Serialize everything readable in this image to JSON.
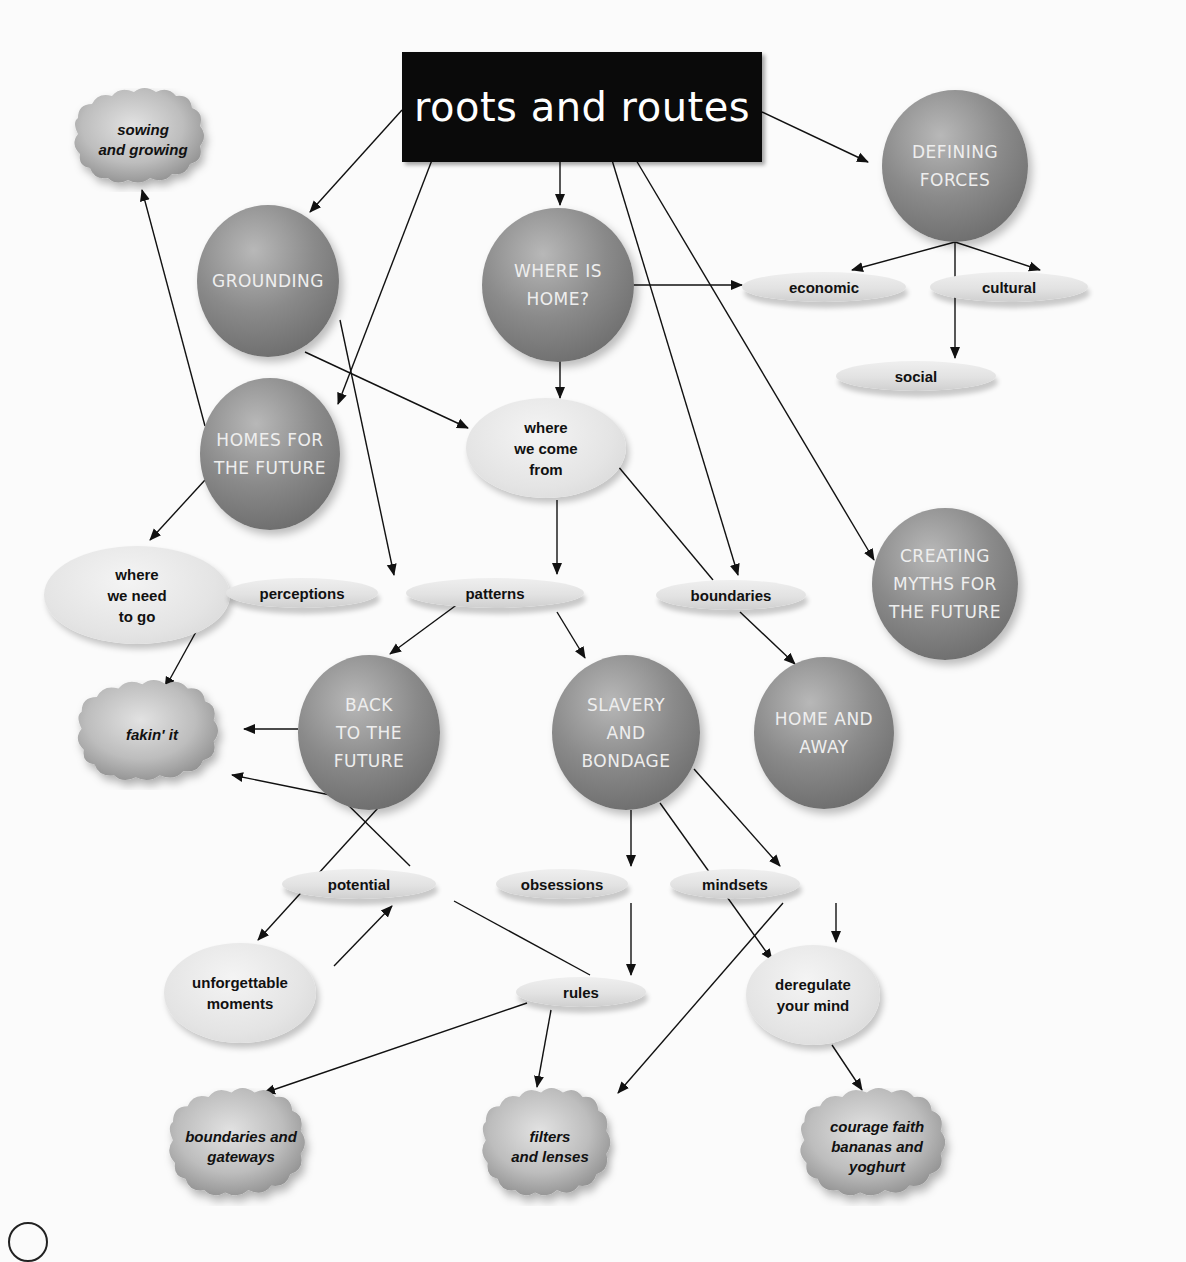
{
  "diagram": {
    "title": "roots and routes",
    "nodes": {
      "title": {
        "label": "roots and routes"
      },
      "sowing": {
        "label": "sowing\nand growing"
      },
      "grounding": {
        "label": "GROUNDING"
      },
      "where_is_home": {
        "label": "WHERE IS\nHOME?"
      },
      "defining_forces": {
        "label": "DEFINING\nFORCES"
      },
      "economic": {
        "label": "economic"
      },
      "cultural": {
        "label": "cultural"
      },
      "social": {
        "label": "social"
      },
      "homes_future": {
        "label": "HOMES FOR\nTHE FUTURE"
      },
      "where_come_from": {
        "label": "where\nwe come\nfrom"
      },
      "where_need_go": {
        "label": "where\nwe need\nto go"
      },
      "perceptions": {
        "label": "perceptions"
      },
      "patterns": {
        "label": "patterns"
      },
      "boundaries": {
        "label": "boundaries"
      },
      "creating_myths": {
        "label": "CREATING\nMYTHS FOR\nTHE FUTURE"
      },
      "fakin_it": {
        "label": "fakin' it"
      },
      "back_future": {
        "label": "BACK\nTO THE\nFUTURE"
      },
      "slavery": {
        "label": "SLAVERY\nAND\nBONDAGE"
      },
      "home_away": {
        "label": "HOME AND\nAWAY"
      },
      "potential": {
        "label": "potential"
      },
      "obsessions": {
        "label": "obsessions"
      },
      "mindsets": {
        "label": "mindsets"
      },
      "unforgettable": {
        "label": "unforgettable\nmoments"
      },
      "rules": {
        "label": "rules"
      },
      "deregulate": {
        "label": "deregulate\nyour mind"
      },
      "boundaries_gateways": {
        "label": "boundaries and\ngateways"
      },
      "filters_lenses": {
        "label": "filters\nand lenses"
      },
      "courage": {
        "label": "courage faith\nbananas and\nyoghurt"
      }
    },
    "edges": [
      {
        "from": "title",
        "to": "grounding"
      },
      {
        "from": "title",
        "to": "homes_future"
      },
      {
        "from": "title",
        "to": "where_is_home"
      },
      {
        "from": "title",
        "to": "boundaries"
      },
      {
        "from": "title",
        "to": "creating_myths"
      },
      {
        "from": "title",
        "to": "defining_forces"
      },
      {
        "from": "defining_forces",
        "to": "economic"
      },
      {
        "from": "defining_forces",
        "to": "cultural"
      },
      {
        "from": "defining_forces",
        "to": "social"
      },
      {
        "from": "where_is_home",
        "to": "economic"
      },
      {
        "from": "where_is_home",
        "to": "where_come_from"
      },
      {
        "from": "grounding",
        "to": "where_come_from"
      },
      {
        "from": "grounding",
        "to": "perceptions"
      },
      {
        "from": "homes_future",
        "to": "sowing"
      },
      {
        "from": "homes_future",
        "to": "where_need_go"
      },
      {
        "from": "where_need_go",
        "to": "perceptions",
        "arrow": false
      },
      {
        "from": "where_need_go",
        "to": "fakin_it"
      },
      {
        "from": "where_come_from",
        "to": "patterns"
      },
      {
        "from": "where_come_from",
        "to": "boundaries",
        "arrow": false
      },
      {
        "from": "patterns",
        "to": "back_future"
      },
      {
        "from": "patterns",
        "to": "slavery"
      },
      {
        "from": "boundaries",
        "to": "home_away"
      },
      {
        "from": "back_future",
        "to": "fakin_it"
      },
      {
        "from": "potential",
        "to": "fakin_it"
      },
      {
        "from": "back_future",
        "to": "unforgettable"
      },
      {
        "from": "unforgettable",
        "to": "potential"
      },
      {
        "from": "potential",
        "to": "rules",
        "arrow": false
      },
      {
        "from": "slavery",
        "to": "obsessions"
      },
      {
        "from": "slavery",
        "to": "mindsets"
      },
      {
        "from": "slavery",
        "to": "deregulate"
      },
      {
        "from": "obsessions",
        "to": "mindsets"
      },
      {
        "from": "obsessions",
        "to": "rules"
      },
      {
        "from": "mindsets",
        "to": "deregulate"
      },
      {
        "from": "mindsets",
        "to": "filters_lenses"
      },
      {
        "from": "rules",
        "to": "boundaries_gateways"
      },
      {
        "from": "rules",
        "to": "filters_lenses"
      },
      {
        "from": "deregulate",
        "to": "courage"
      }
    ]
  }
}
